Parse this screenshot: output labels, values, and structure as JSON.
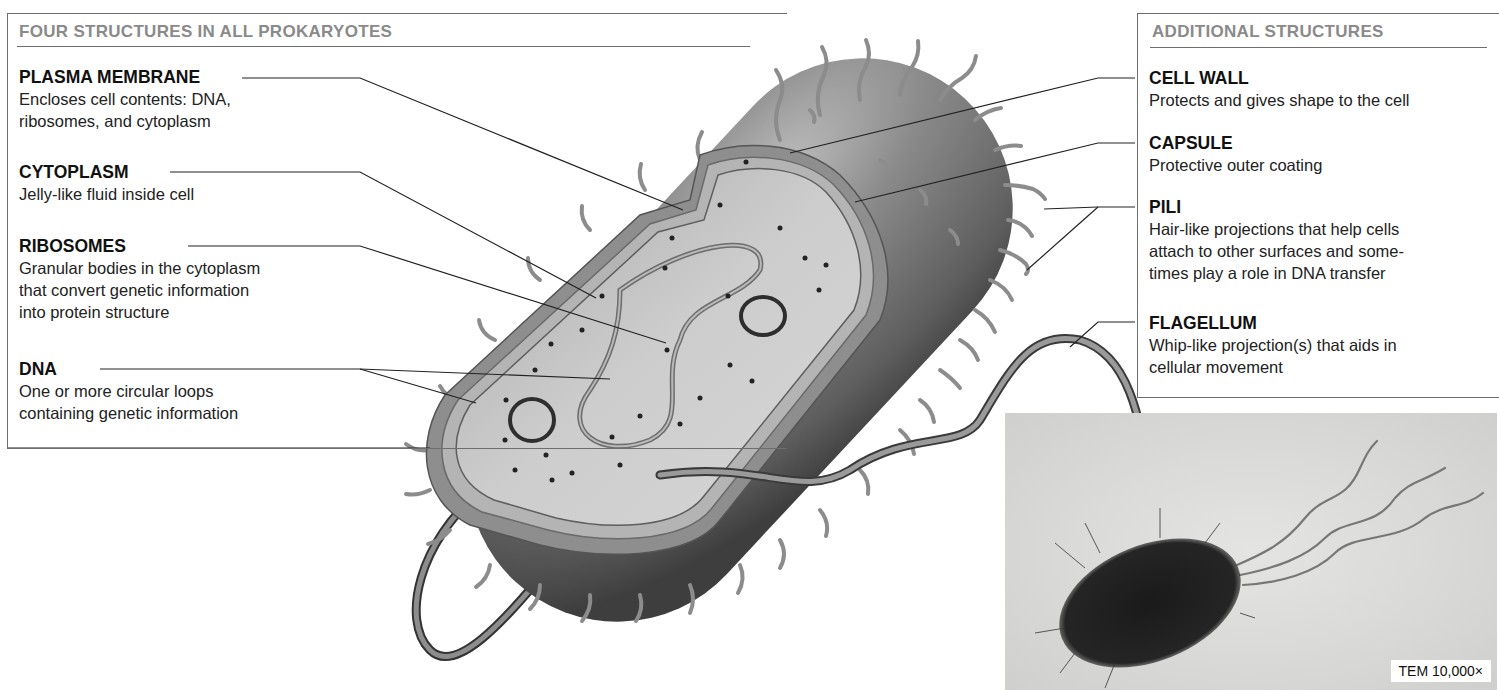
{
  "left_panel": {
    "title": "FOUR STRUCTURES IN ALL PROKARYOTES",
    "items": [
      {
        "name": "PLASMA MEMBRANE",
        "desc_lines": [
          "Encloses cell contents: DNA,",
          "ribosomes, and cytoplasm"
        ]
      },
      {
        "name": "CYTOPLASM",
        "desc_lines": [
          "Jelly-like fluid inside cell"
        ]
      },
      {
        "name": "RIBOSOMES",
        "desc_lines": [
          "Granular bodies in the cytoplasm",
          "that convert genetic information",
          "into protein structure"
        ]
      },
      {
        "name": "DNA",
        "desc_lines": [
          "One or more circular loops",
          "containing genetic information"
        ]
      }
    ]
  },
  "right_panel": {
    "title": "ADDITIONAL STRUCTURES",
    "items": [
      {
        "name": "CELL WALL",
        "desc_lines": [
          "Protects and gives shape to the cell"
        ]
      },
      {
        "name": "CAPSULE",
        "desc_lines": [
          "Protective outer coating"
        ]
      },
      {
        "name": "PILI",
        "desc_lines": [
          "Hair-like projections that help cells",
          "attach to other surfaces and some-",
          "times play a role in DNA transfer"
        ]
      },
      {
        "name": "FLAGELLUM",
        "desc_lines": [
          "Whip-like projection(s) that aids in",
          "cellular movement"
        ]
      }
    ]
  },
  "micrograph": {
    "caption": "TEM 10,000×"
  },
  "colors": {
    "box_border": "#6e6e6e",
    "title_gray": "#8a8a8a",
    "cell_dark": "#5a5a5a",
    "cytoplasm": "#c9c9c9",
    "pili": "#8c8c8c"
  }
}
